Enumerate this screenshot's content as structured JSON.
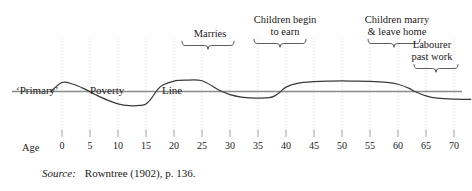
{
  "figure": {
    "background": "#ffffff",
    "ink": "#1a1a1a",
    "curve_color": "#3a3a3a",
    "poverty_line_color": "#8a8a8a",
    "gridline_color": "#cfcfcf"
  },
  "inline_labels": [
    {
      "name": "primary-label",
      "text": "‘Primary’",
      "x": 16,
      "y": 84
    },
    {
      "name": "poverty-label",
      "text": "Poverty",
      "x": 90,
      "y": 84
    },
    {
      "name": "line-label",
      "text": "Line",
      "x": 162,
      "y": 84
    }
  ],
  "annotations": [
    {
      "name": "marries",
      "text": "Marries",
      "x": 178,
      "y": 28,
      "width": 64,
      "brace_x": 182,
      "brace_y": 41,
      "brace_w": 52
    },
    {
      "name": "children-begin-to-earn",
      "text": "Children begin\nto earn",
      "x": 239,
      "y": 14,
      "width": 92,
      "brace_x": 254,
      "brace_y": 39,
      "brace_w": 52
    },
    {
      "name": "children-marry-leave-home",
      "text": "Children marry\n& leave home",
      "x": 348,
      "y": 14,
      "width": 98,
      "brace_x": 368,
      "brace_y": 39,
      "brace_w": 52
    },
    {
      "name": "labourer-past-work",
      "text": "Labourer\npast work",
      "x": 396,
      "y": 39,
      "width": 72,
      "brace_x": 414,
      "brace_y": 64,
      "brace_w": 44
    }
  ],
  "axis": {
    "name_label": "Age",
    "name_x": 22,
    "name_y": 142,
    "tick_y": 141,
    "tick_labels": [
      "0",
      "5",
      "10",
      "15",
      "20",
      "25",
      "30",
      "35",
      "40",
      "45",
      "50",
      "55",
      "60",
      "65",
      "70"
    ]
  },
  "source": {
    "key": "Source:",
    "value": "Rowntree (1902), p. 136."
  },
  "chart_data": {
    "type": "line",
    "title": "",
    "xlabel": "Age",
    "ylabel": "",
    "grid": true,
    "legend": null,
    "xlim": [
      -2,
      73
    ],
    "ylim": [
      -1.25,
      1.25
    ],
    "x_ticks": [
      0,
      5,
      10,
      15,
      20,
      25,
      30,
      35,
      40,
      45,
      50,
      55,
      60,
      65,
      70
    ],
    "reference_lines": [
      {
        "name": "poverty-line",
        "orientation": "horizontal",
        "y": 0,
        "label": "‘Primary’ Poverty Line"
      }
    ],
    "series": [
      {
        "name": "Life-cycle of poverty",
        "x": [
          -2,
          0,
          2,
          4,
          6,
          8,
          10,
          12,
          14,
          15,
          16,
          17,
          18,
          20,
          22,
          25,
          28,
          30,
          32,
          35,
          37,
          38,
          39,
          40,
          42,
          45,
          48,
          50,
          52,
          55,
          58,
          60,
          62,
          63,
          65,
          67,
          70,
          73
        ],
        "y": [
          0.0,
          0.62,
          0.5,
          0.18,
          -0.22,
          -0.58,
          -0.85,
          -0.98,
          -0.96,
          -0.86,
          -0.45,
          0.1,
          0.45,
          0.72,
          0.78,
          0.74,
          0.1,
          -0.22,
          -0.38,
          -0.45,
          -0.42,
          -0.3,
          -0.02,
          0.3,
          0.56,
          0.68,
          0.72,
          0.73,
          0.72,
          0.7,
          0.63,
          0.5,
          0.22,
          0.0,
          -0.3,
          -0.46,
          -0.53,
          -0.54
        ]
      }
    ],
    "annotated_events": [
      {
        "label": "Marries",
        "age": 25
      },
      {
        "label": "Children begin to earn",
        "age": 38
      },
      {
        "label": "Children marry & leave home",
        "age": 58
      },
      {
        "label": "Labourer past work",
        "age": 66
      }
    ]
  }
}
